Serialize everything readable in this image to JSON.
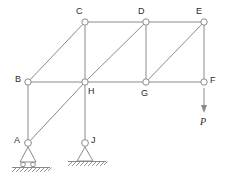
{
  "figure": {
    "type": "truss-diagram",
    "stroke_color": "#8a8a8a",
    "label_color": "#2b2b2b",
    "background_color": "#ffffff"
  },
  "joints": [
    {
      "id": "C",
      "label": "C",
      "x": 85,
      "y": 22,
      "label_x": 76,
      "label_y": 7
    },
    {
      "id": "D",
      "label": "D",
      "x": 146,
      "y": 22,
      "label_x": 138,
      "label_y": 7
    },
    {
      "id": "E",
      "label": "E",
      "x": 204,
      "y": 22,
      "label_x": 196,
      "label_y": 7
    },
    {
      "id": "B",
      "label": "B",
      "x": 28,
      "y": 82,
      "label_x": 15,
      "label_y": 75
    },
    {
      "id": "H",
      "label": "H",
      "x": 85,
      "y": 82,
      "label_x": 88,
      "label_y": 87
    },
    {
      "id": "G",
      "label": "G",
      "x": 146,
      "y": 82,
      "label_x": 141,
      "label_y": 89
    },
    {
      "id": "F",
      "label": "F",
      "x": 204,
      "y": 82,
      "label_x": 210,
      "label_y": 76
    },
    {
      "id": "A",
      "label": "A",
      "x": 28,
      "y": 143,
      "label_x": 14,
      "label_y": 136
    },
    {
      "id": "J",
      "label": "J",
      "x": 85,
      "y": 143,
      "label_x": 91,
      "label_y": 136
    }
  ],
  "members": [
    {
      "from": "C",
      "to": "D",
      "kind": "chord"
    },
    {
      "from": "D",
      "to": "E",
      "kind": "chord"
    },
    {
      "from": "B",
      "to": "H",
      "kind": "chord"
    },
    {
      "from": "H",
      "to": "G",
      "kind": "chord"
    },
    {
      "from": "G",
      "to": "F",
      "kind": "chord"
    },
    {
      "from": "C",
      "to": "H",
      "kind": "vertical"
    },
    {
      "from": "D",
      "to": "G",
      "kind": "vertical"
    },
    {
      "from": "E",
      "to": "F",
      "kind": "vertical"
    },
    {
      "from": "B",
      "to": "A",
      "kind": "vertical"
    },
    {
      "from": "H",
      "to": "J",
      "kind": "vertical"
    },
    {
      "from": "B",
      "to": "C",
      "kind": "diagonal"
    },
    {
      "from": "H",
      "to": "D",
      "kind": "diagonal"
    },
    {
      "from": "G",
      "to": "E",
      "kind": "diagonal"
    },
    {
      "from": "A",
      "to": "H",
      "kind": "diagonal"
    }
  ],
  "supports": [
    {
      "at": "A",
      "type": "roller",
      "label": "roller-support"
    },
    {
      "at": "J",
      "type": "pin",
      "label": "pin-support"
    }
  ],
  "load": {
    "label": "P",
    "at": "F",
    "direction": "down",
    "start_x": 204,
    "start_y": 88,
    "end_y": 113,
    "label_x": 200,
    "label_y": 117
  }
}
